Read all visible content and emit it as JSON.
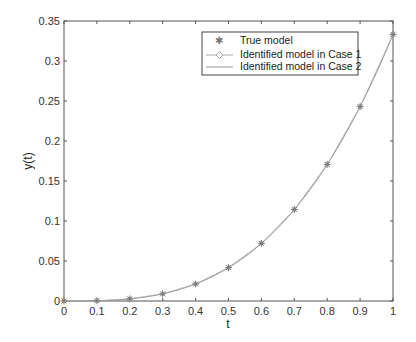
{
  "chart_data": {
    "type": "line",
    "title": "",
    "xlabel": "t",
    "ylabel": "y(t)",
    "xlim": [
      0,
      1
    ],
    "ylim": [
      0,
      0.35
    ],
    "grid": false,
    "legend_position": "upper-right (inside, near top center-right)",
    "x_ticks": [
      "0",
      "0.1",
      "0.2",
      "0.3",
      "0.4",
      "0.5",
      "0.6",
      "0.7",
      "0.8",
      "0.9",
      "1"
    ],
    "y_ticks": [
      "0",
      "0.05",
      "0.1",
      "0.15",
      "0.2",
      "0.25",
      "0.3",
      "0.35"
    ],
    "x": [
      0,
      0.1,
      0.2,
      0.3,
      0.4,
      0.5,
      0.6,
      0.7,
      0.8,
      0.9,
      1.0
    ],
    "series": [
      {
        "name": "True model",
        "style": "star markers",
        "values": [
          0,
          0.0003,
          0.0027,
          0.009,
          0.0213,
          0.0417,
          0.072,
          0.1143,
          0.1707,
          0.243,
          0.3333
        ]
      },
      {
        "name": "Identified model in Case 1",
        "style": "line with diamond markers",
        "values": [
          0,
          0.0003,
          0.0027,
          0.009,
          0.0213,
          0.0417,
          0.072,
          0.1143,
          0.1707,
          0.243,
          0.3333
        ]
      },
      {
        "name": "Identified model in Case 2",
        "style": "solid line",
        "values": [
          0,
          0.0003,
          0.0027,
          0.009,
          0.0213,
          0.0417,
          0.072,
          0.1143,
          0.1707,
          0.243,
          0.3333
        ]
      }
    ],
    "colors": {
      "line": "#8a8a8a",
      "marker": "#7a7a7a",
      "axis": "#555555"
    }
  },
  "legend": {
    "items": [
      "True model",
      "Identified model in Case 1",
      "Identified model in Case 2"
    ]
  }
}
